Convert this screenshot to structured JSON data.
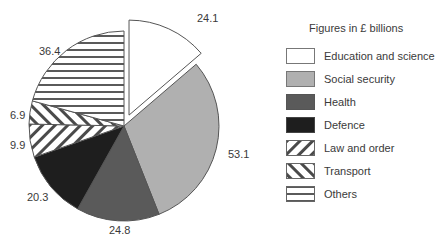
{
  "chart_data": {
    "type": "pie",
    "title": "",
    "legend_title": "Figures in £ billions",
    "legend_position": "right",
    "start_angle_deg": 0,
    "direction": "clockwise",
    "exploded": [
      "Education and science"
    ],
    "categories": [
      "Education and science",
      "Social security",
      "Health",
      "Defence",
      "Law and order",
      "Transport",
      "Others"
    ],
    "values": [
      24.1,
      53.1,
      24.8,
      20.3,
      9.9,
      6.9,
      36.4
    ],
    "value_labels": [
      "24.1",
      "53.1",
      "24.8",
      "20.3",
      "9.9",
      "6.9",
      "36.4"
    ],
    "fills": [
      {
        "type": "solid",
        "color": "#ffffff"
      },
      {
        "type": "solid",
        "color": "#b0b0b0"
      },
      {
        "type": "solid",
        "color": "#5a5a5a"
      },
      {
        "type": "solid",
        "color": "#1e1e1e"
      },
      {
        "type": "hatch",
        "pattern": "diagonal-forward",
        "color": "#444444"
      },
      {
        "type": "hatch",
        "pattern": "diagonal-back",
        "color": "#444444"
      },
      {
        "type": "hatch",
        "pattern": "horizontal",
        "color": "#555555"
      }
    ]
  },
  "legend": {
    "title": "Figures in £ billions",
    "items": [
      {
        "label": "Education and science"
      },
      {
        "label": "Social security"
      },
      {
        "label": "Health"
      },
      {
        "label": "Defence"
      },
      {
        "label": "Law and order"
      },
      {
        "label": "Transport"
      },
      {
        "label": "Others"
      }
    ]
  },
  "labels": {
    "education": "24.1",
    "social_security": "53.1",
    "health": "24.8",
    "defence": "20.3",
    "law_and_order": "9.9",
    "transport": "6.9",
    "others": "36.4"
  }
}
